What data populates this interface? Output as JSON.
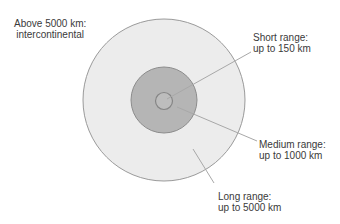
{
  "diagram": {
    "type": "concentric-range-circles",
    "colors": {
      "background": "#ffffff",
      "outer_fill": "#ececec",
      "outer_stroke": "#9a9a9a",
      "medium_fill": "#b5b5b5",
      "medium_stroke": "#8c8c8c",
      "inner_fill": "#bdbdbd",
      "inner_stroke": "#858585",
      "leader_line": "#a8a8a8",
      "text": "#3a3a3a"
    },
    "labels": {
      "intercontinental": {
        "line1": "Above 5000 km:",
        "line2": "intercontinental"
      },
      "short": {
        "line1": "Short range:",
        "line2": "up to 150 km"
      },
      "medium": {
        "line1": "Medium range:",
        "line2": "up to 1000 km"
      },
      "long": {
        "line1": "Long range:",
        "line2": "up to 5000 km"
      }
    }
  }
}
